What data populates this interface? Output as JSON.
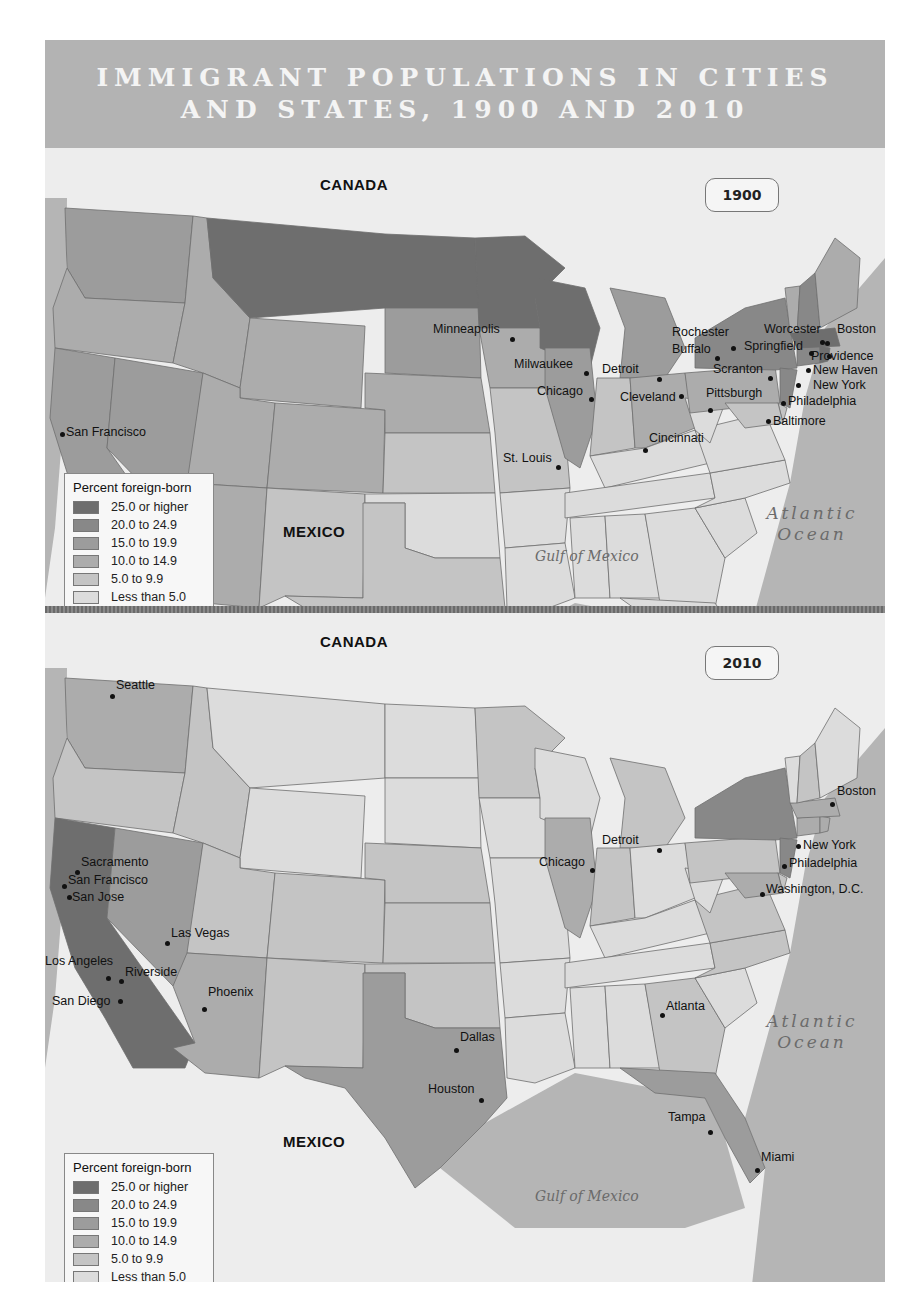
{
  "title": {
    "line1": "IMMIGRANT POPULATIONS IN CITIES",
    "line2": "AND STATES, 1900 AND 2010"
  },
  "colors": {
    "frame": "#bdbdbd",
    "title_band": "#b3b3b3",
    "title_text": "#f4f4f4",
    "land_outside": "#ededed",
    "water": "#b5b5b5",
    "border": "#6f6f6f",
    "class_colors": [
      "#6e6e6e",
      "#888888",
      "#9c9c9c",
      "#acacac",
      "#c4c4c4",
      "#dcdcdc"
    ]
  },
  "legend": {
    "title": "Percent foreign-born",
    "items": [
      {
        "label": "25.0 or higher",
        "class": 0
      },
      {
        "label": "20.0 to 24.9",
        "class": 1
      },
      {
        "label": "15.0 to 19.9",
        "class": 2
      },
      {
        "label": "10.0 to 14.9",
        "class": 3
      },
      {
        "label": "5.0 to 9.9",
        "class": 4
      },
      {
        "label": "Less than 5.0",
        "class": 5
      }
    ]
  },
  "maps": [
    {
      "year": "1900",
      "labels": {
        "canada": "CANADA",
        "mexico": "MEXICO",
        "atlantic_line1": "Atlantic",
        "atlantic_line2": "Ocean",
        "gulf": "Gulf of Mexico"
      },
      "states": {
        "WA": 2,
        "OR": 3,
        "CA": 2,
        "NV": 2,
        "ID": 3,
        "MT": 0,
        "WY": 3,
        "UT": 3,
        "AZ": 3,
        "CO": 3,
        "NM": 4,
        "ND": 0,
        "SD": 2,
        "NE": 3,
        "KS": 4,
        "OK": 5,
        "TX": 4,
        "MN": 0,
        "IA": 3,
        "MO": 4,
        "AR": 5,
        "LA": 5,
        "WI": 0,
        "IL": 2,
        "MI": 2,
        "IN": 4,
        "OH": 3,
        "KY": 5,
        "TN": 5,
        "MS": 5,
        "AL": 5,
        "GA": 5,
        "FL": 5,
        "SC": 5,
        "NC": 5,
        "VA": 5,
        "WV": 5,
        "PA": 3,
        "NY": 1,
        "NJ": 1,
        "DE": 4,
        "MD": 4,
        "CT": 1,
        "RI": 0,
        "MA": 0,
        "VT": 3,
        "NH": 1,
        "ME": 3
      },
      "cities": [
        {
          "name": "Minneapolis",
          "x": 467,
          "y": 141,
          "lx": 388,
          "ly": 132
        },
        {
          "name": "Milwaukee",
          "x": 541,
          "y": 175,
          "lx": 469,
          "ly": 167
        },
        {
          "name": "Chicago",
          "x": 546,
          "y": 201,
          "lx": 492,
          "ly": 194
        },
        {
          "name": "Detroit",
          "x": 614,
          "y": 181,
          "lx": 557,
          "ly": 172
        },
        {
          "name": "Cleveland",
          "x": 636,
          "y": 198,
          "lx": 575,
          "ly": 200
        },
        {
          "name": "Cincinnati",
          "x": 600,
          "y": 252,
          "lx": 604,
          "ly": 241
        },
        {
          "name": "St. Louis",
          "x": 513,
          "y": 269,
          "lx": 458,
          "ly": 261
        },
        {
          "name": "Rochester",
          "x": 688,
          "y": 150,
          "lx": 627,
          "ly": 135
        },
        {
          "name": "Buffalo",
          "x": 672,
          "y": 160,
          "lx": 627,
          "ly": 152
        },
        {
          "name": "Scranton",
          "x": 725,
          "y": 180,
          "lx": 668,
          "ly": 172
        },
        {
          "name": "Pittsburgh",
          "x": 665,
          "y": 212,
          "lx": 661,
          "ly": 196
        },
        {
          "name": "Worcester",
          "x": 777,
          "y": 144,
          "lx": 719,
          "ly": 132
        },
        {
          "name": "Springfield",
          "x": 766,
          "y": 155,
          "lx": 699,
          "ly": 149
        },
        {
          "name": "Boston",
          "x": 782,
          "y": 145,
          "lx": 792,
          "ly": 132
        },
        {
          "name": "Providence",
          "x": 784,
          "y": 158,
          "lx": 766,
          "ly": 159
        },
        {
          "name": "New Haven",
          "x": 763,
          "y": 172,
          "lx": 768,
          "ly": 173
        },
        {
          "name": "New York",
          "x": 753,
          "y": 187,
          "lx": 768,
          "ly": 188
        },
        {
          "name": "Philadelphia",
          "x": 738,
          "y": 205,
          "lx": 743,
          "ly": 204
        },
        {
          "name": "Baltimore",
          "x": 723,
          "y": 223,
          "lx": 728,
          "ly": 224
        },
        {
          "name": "San Francisco",
          "x": 17,
          "y": 236,
          "lx": 21,
          "ly": 235
        }
      ]
    },
    {
      "year": "2010",
      "labels": {
        "canada": "CANADA",
        "mexico": "MEXICO",
        "atlantic_line1": "Atlantic",
        "atlantic_line2": "Ocean",
        "gulf": "Gulf of Mexico"
      },
      "states": {
        "WA": 3,
        "OR": 4,
        "CA": 0,
        "NV": 2,
        "ID": 4,
        "MT": 5,
        "WY": 5,
        "UT": 4,
        "AZ": 3,
        "CO": 4,
        "NM": 4,
        "ND": 5,
        "SD": 5,
        "NE": 4,
        "KS": 4,
        "OK": 4,
        "TX": 2,
        "MN": 4,
        "IA": 5,
        "MO": 5,
        "AR": 5,
        "LA": 5,
        "WI": 5,
        "IL": 3,
        "MI": 4,
        "IN": 4,
        "OH": 5,
        "KY": 5,
        "TN": 5,
        "MS": 5,
        "AL": 5,
        "GA": 4,
        "FL": 2,
        "SC": 5,
        "NC": 4,
        "VA": 4,
        "WV": 5,
        "PA": 4,
        "NY": 1,
        "NJ": 1,
        "DE": 4,
        "MD": 3,
        "CT": 3,
        "RI": 3,
        "MA": 3,
        "VT": 5,
        "NH": 4,
        "ME": 5
      },
      "cities": [
        {
          "name": "Seattle",
          "x": 67,
          "y": 28,
          "lx": 71,
          "ly": 18
        },
        {
          "name": "Sacramento",
          "x": 32,
          "y": 204,
          "lx": 36,
          "ly": 195
        },
        {
          "name": "San Francisco",
          "x": 19,
          "y": 218,
          "lx": 23,
          "ly": 213
        },
        {
          "name": "San Jose",
          "x": 24,
          "y": 229,
          "lx": 27,
          "ly": 230
        },
        {
          "name": "Las Vegas",
          "x": 122,
          "y": 275,
          "lx": 126,
          "ly": 266
        },
        {
          "name": "Los Angeles",
          "x": 63,
          "y": 310,
          "lx": 0,
          "ly": 294
        },
        {
          "name": "Riverside",
          "x": 76,
          "y": 313,
          "lx": 80,
          "ly": 305
        },
        {
          "name": "San Diego",
          "x": 75,
          "y": 333,
          "lx": 7,
          "ly": 334
        },
        {
          "name": "Phoenix",
          "x": 159,
          "y": 341,
          "lx": 163,
          "ly": 325
        },
        {
          "name": "Dallas",
          "x": 411,
          "y": 382,
          "lx": 415,
          "ly": 370
        },
        {
          "name": "Houston",
          "x": 436,
          "y": 432,
          "lx": 383,
          "ly": 422
        },
        {
          "name": "Chicago",
          "x": 547,
          "y": 202,
          "lx": 494,
          "ly": 195
        },
        {
          "name": "Detroit",
          "x": 614,
          "y": 182,
          "lx": 557,
          "ly": 173
        },
        {
          "name": "Boston",
          "x": 787,
          "y": 136,
          "lx": 792,
          "ly": 124
        },
        {
          "name": "New York",
          "x": 753,
          "y": 178,
          "lx": 758,
          "ly": 178
        },
        {
          "name": "Philadelphia",
          "x": 739,
          "y": 198,
          "lx": 744,
          "ly": 196
        },
        {
          "name": "Washington, D.C.",
          "x": 717,
          "y": 226,
          "lx": 721,
          "ly": 222
        },
        {
          "name": "Atlanta",
          "x": 617,
          "y": 347,
          "lx": 621,
          "ly": 339
        },
        {
          "name": "Tampa",
          "x": 665,
          "y": 464,
          "lx": 623,
          "ly": 450
        },
        {
          "name": "Miami",
          "x": 712,
          "y": 502,
          "lx": 716,
          "ly": 490
        }
      ]
    }
  ]
}
